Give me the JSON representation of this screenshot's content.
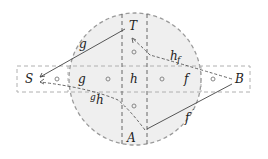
{
  "diagram": {
    "nodes": {
      "S": "S",
      "T": "T",
      "B": "B",
      "A": "A"
    },
    "regions": {
      "g": "g",
      "h": "h",
      "f": "f"
    },
    "edge_labels": {
      "g_top": "g",
      "h_f": "h",
      "h_f_sub": "f",
      "g_h_pre": "g",
      "g_h": "h",
      "f_prime": "f",
      "f_prime_mark": "′"
    },
    "colors": {
      "disk_fill": "#f0f0f0",
      "dashed": "#9a9a9a",
      "line": "#333333"
    }
  }
}
